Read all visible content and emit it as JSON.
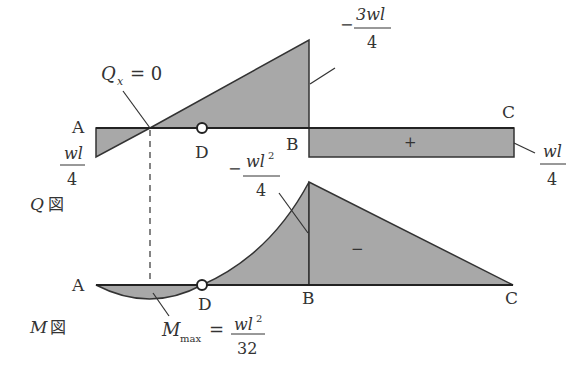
{
  "figure": {
    "top_cropped_text": "",
    "shear_diagram": {
      "label": "Q図",
      "label_var": "Q",
      "label_kanji": "図",
      "points": {
        "A": "A",
        "D": "D",
        "B": "B",
        "C": "C"
      },
      "zero_label": "Q",
      "zero_sub": "x",
      "zero_eq": "= 0",
      "left_value": {
        "num": "wl",
        "den": "4"
      },
      "peak_value": {
        "sign": "−",
        "num": "3wl",
        "den": "4"
      },
      "right_value": {
        "num": "wl",
        "den": "4"
      },
      "right_sign": "+"
    },
    "moment_diagram": {
      "label": "M図",
      "label_var": "M",
      "label_kanji": "図",
      "points": {
        "A": "A",
        "D": "D",
        "B": "B",
        "C": "C"
      },
      "peak_value": {
        "sign": "−",
        "num": "wl",
        "sup": "2",
        "den": "4"
      },
      "max_label": "M",
      "max_sub": "max",
      "max_eq": "=",
      "max_value": {
        "num": "wl",
        "sup": "2",
        "den": "32"
      },
      "region_sign": "−"
    },
    "colors": {
      "fill": "#a8a8a8",
      "line": "#333333",
      "text": "#333333"
    }
  }
}
